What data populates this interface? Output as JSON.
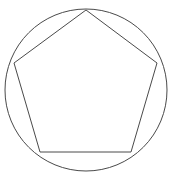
{
  "figure": {
    "title": "Regular pentagon inscribed in a circle",
    "background_color": "#ffffff",
    "stroke_color": "#4a4a4a",
    "stroke_width": 1,
    "canvas": {
      "width": 173,
      "height": 181
    }
  },
  "chart_data": {
    "type": "diagram",
    "title": "Regular pentagon inscribed in a circle",
    "subtitle": "",
    "xlabel": "",
    "ylabel": "",
    "grid": false,
    "legend": false,
    "axis_visible": false,
    "xlim": [
      0,
      173
    ],
    "ylim": [
      0,
      181
    ],
    "shapes": [
      {
        "name": "circumscribed-circle",
        "kind": "circle",
        "center": [
          86,
          90
        ],
        "radius": 81,
        "fill": "none",
        "stroke": "#4a4a4a",
        "stroke_width": 1
      },
      {
        "name": "inscribed-pentagon",
        "kind": "polygon",
        "sides": 5,
        "regular": true,
        "vertices": [
          [
            86,
            10
          ],
          [
            157,
            63
          ],
          [
            131,
            152
          ],
          [
            40,
            152
          ],
          [
            14,
            63
          ]
        ],
        "vertex_labels": [
          "apex-top",
          "upper-right",
          "lower-right",
          "lower-left",
          "upper-left"
        ],
        "fill": "none",
        "stroke": "#4a4a4a",
        "stroke_width": 1
      }
    ],
    "annotations": []
  }
}
